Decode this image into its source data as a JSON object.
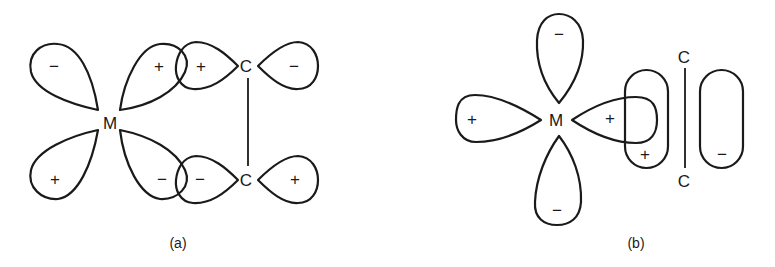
{
  "figure": {
    "panel_a": {
      "caption": "(a)",
      "metal_label": "M",
      "carbon_top_label": "C",
      "carbon_bottom_label": "C",
      "metal_orbital_signs": {
        "upper_left": "−",
        "upper_right": "+",
        "lower_left": "+",
        "lower_right": "−"
      },
      "carbon_top_signs": {
        "left": "+",
        "right": "−"
      },
      "carbon_bottom_signs": {
        "left": "−",
        "right": "+"
      }
    },
    "panel_b": {
      "caption": "(b)",
      "metal_label": "M",
      "carbon_top_label": "C",
      "carbon_bottom_label": "C",
      "metal_orbital_signs": {
        "top": "−",
        "bottom": "−",
        "left": "+",
        "right": "+"
      },
      "pi_orbital_signs": {
        "left": "+",
        "right": "−"
      }
    }
  }
}
